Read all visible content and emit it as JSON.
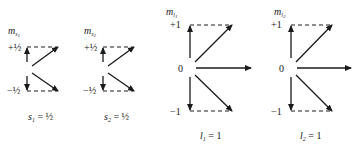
{
  "diagrams": [
    {
      "id": "spin-1",
      "axis_label": "m",
      "axis_sub": "s",
      "axis_sub2": "1",
      "levels": [
        "+½",
        "−½"
      ],
      "caption_var": "s",
      "caption_sub": "1",
      "caption_value": " = ½"
    },
    {
      "id": "spin-2",
      "axis_label": "m",
      "axis_sub": "s",
      "axis_sub2": "2",
      "levels": [
        "+½",
        "−½"
      ],
      "caption_var": "s",
      "caption_sub": "2",
      "caption_value": " = ½"
    },
    {
      "id": "orbital-1",
      "axis_label": "m",
      "axis_sub": "l",
      "axis_sub2": "1",
      "levels": [
        "+1",
        "0",
        "−1"
      ],
      "caption_var": "l",
      "caption_sub": "1",
      "caption_value": " = 1"
    },
    {
      "id": "orbital-2",
      "axis_label": "m",
      "axis_sub": "l",
      "axis_sub2": "2",
      "levels": [
        "+1",
        "0",
        "−1"
      ],
      "caption_var": "l",
      "caption_sub": "2",
      "caption_value": " = 1"
    }
  ]
}
